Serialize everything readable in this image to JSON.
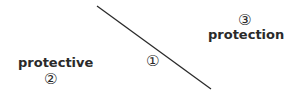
{
  "diagram": {
    "line": {
      "x1": 97,
      "y1": 6,
      "x2": 211,
      "y2": 89,
      "color": "#2a2a2a"
    },
    "labels": [
      {
        "id": "label-1",
        "marker": "①",
        "text": ""
      },
      {
        "id": "label-2",
        "marker": "②",
        "text": "protective"
      },
      {
        "id": "label-3",
        "marker": "③",
        "text": "protection"
      }
    ]
  }
}
